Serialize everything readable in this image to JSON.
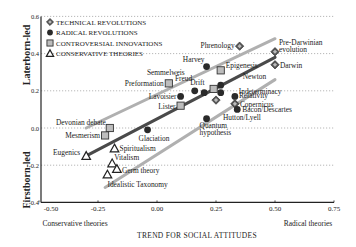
{
  "chart_data": {
    "type": "scatter",
    "title": "",
    "xlabel": "TREND FOR SOCIAL ATTITUDES",
    "xlabel_left": "Conservative theories",
    "xlabel_right": "Radical theories",
    "ylabel_top": "Laterborn-led",
    "ylabel_bottom": "Firstborn-led",
    "xlim": [
      -0.5,
      0.75
    ],
    "ylim": [
      -0.4,
      0.6
    ],
    "xticks": [
      "-0.50",
      "-0.25",
      "0.00",
      "0.25",
      "0.50",
      "0.75"
    ],
    "yticks": [
      "0.6",
      "0.4",
      "0.2",
      "0.0",
      "-0.2",
      "-0.4"
    ],
    "grid": "dotted horizontal at 0.4, 0.2, 0.0, -0.2",
    "legend_position": "upper left",
    "legend": [
      {
        "key": "technical",
        "label": "TECHNICAL REVOLUTIONS",
        "marker": "diamond"
      },
      {
        "key": "radical",
        "label": "RADICAL REVOLUTIONS",
        "marker": "circle"
      },
      {
        "key": "controversial",
        "label": "CONTROVERSIAL INNOVATIONS",
        "marker": "square"
      },
      {
        "key": "conservative",
        "label": "CONSERVATIVE THEORIES",
        "marker": "triangle"
      }
    ],
    "points": [
      {
        "label": "Phrenology",
        "cat": "technical",
        "x": 0.35,
        "y": 0.44
      },
      {
        "label": "Pre-Darwinian evolution",
        "cat": "technical",
        "x": 0.5,
        "y": 0.41
      },
      {
        "label": "Darwin",
        "cat": "technical",
        "x": 0.5,
        "y": 0.34
      },
      {
        "label": "Copernicus",
        "cat": "technical",
        "x": 0.33,
        "y": 0.13
      },
      {
        "label": "Hutton/Lyell",
        "cat": "technical",
        "x": 0.25,
        "y": 0.15
      },
      {
        "label": "Harvey",
        "cat": "radical",
        "x": 0.21,
        "y": 0.33
      },
      {
        "label": "Semmelweis",
        "cat": "radical",
        "x": 0.16,
        "y": 0.2
      },
      {
        "label": "Freud",
        "cat": "radical",
        "x": 0.2,
        "y": 0.19
      },
      {
        "label": "Newton",
        "cat": "radical",
        "x": 0.27,
        "y": 0.23
      },
      {
        "label": "Indeterminacy",
        "cat": "radical",
        "x": 0.27,
        "y": 0.19
      },
      {
        "label": "Lavoisier",
        "cat": "radical",
        "x": 0.1,
        "y": 0.17
      },
      {
        "label": "Relativity",
        "cat": "radical",
        "x": 0.33,
        "y": 0.17
      },
      {
        "label": "Bacon/Descartes",
        "cat": "radical",
        "x": 0.34,
        "y": 0.1
      },
      {
        "label": "Quantum hypothesis",
        "cat": "radical",
        "x": 0.21,
        "y": 0.05
      },
      {
        "label": "Glaciation",
        "cat": "radical",
        "x": -0.04,
        "y": -0.01
      },
      {
        "label": "Epigenesis",
        "cat": "controversial",
        "x": 0.27,
        "y": 0.31
      },
      {
        "label": "Drift",
        "cat": "controversial",
        "x": 0.24,
        "y": 0.21
      },
      {
        "label": "Preformation",
        "cat": "controversial",
        "x": 0.05,
        "y": 0.24
      },
      {
        "label": "Lister",
        "cat": "controversial",
        "x": 0.1,
        "y": 0.12
      },
      {
        "label": "Devonian debate",
        "cat": "controversial",
        "x": -0.2,
        "y": 0.0
      },
      {
        "label": "Mesmerism",
        "cat": "controversial",
        "x": -0.22,
        "y": -0.04
      },
      {
        "label": "Eugenics",
        "cat": "conservative",
        "x": -0.3,
        "y": -0.15
      },
      {
        "label": "Spiritualism",
        "cat": "conservative",
        "x": -0.18,
        "y": -0.11
      },
      {
        "label": "Vitalism",
        "cat": "conservative",
        "x": -0.19,
        "y": -0.19
      },
      {
        "label": "Germ theory",
        "cat": "conservative",
        "x": -0.17,
        "y": -0.22
      },
      {
        "label": "Idealistic Taxonomy",
        "cat": "conservative",
        "x": -0.21,
        "y": -0.25
      }
    ],
    "trend_lines": [
      {
        "name": "upper confidence band",
        "color": "#b0b0b0",
        "from": [
          -0.3,
          0.0
        ],
        "to": [
          0.5,
          0.48
        ]
      },
      {
        "name": "regression line",
        "color": "#4a4a4a",
        "from": [
          -0.3,
          -0.15
        ],
        "to": [
          0.5,
          0.38
        ]
      },
      {
        "name": "lower confidence band",
        "color": "#b0b0b0",
        "from": [
          -0.22,
          -0.32
        ],
        "to": [
          0.5,
          0.26
        ]
      }
    ]
  },
  "colors": {
    "marker_dark": "#2a2a2a",
    "marker_square_fill": "#bdbdbd",
    "band": "#b5b5b5",
    "regression": "#4d4d4d",
    "grid": "#999999"
  }
}
